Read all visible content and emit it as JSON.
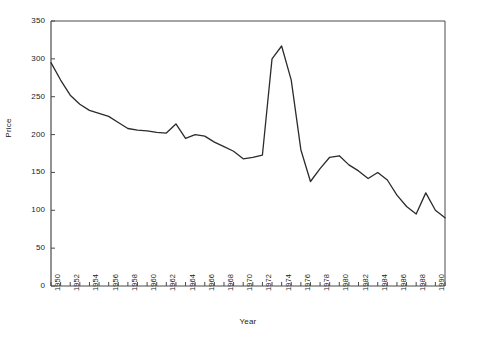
{
  "chart_data": {
    "type": "line",
    "title": "",
    "xlabel": "Year",
    "ylabel": "Price",
    "xlim": [
      1950,
      1991
    ],
    "ylim": [
      0,
      350
    ],
    "grid": false,
    "legend": null,
    "yticks": [
      0,
      50,
      100,
      150,
      200,
      250,
      300,
      350
    ],
    "ytick_labels": [
      "0",
      "50",
      "100",
      "150",
      "200",
      "250",
      "300",
      "350"
    ],
    "xticks": [
      1950,
      1951,
      1952,
      1953,
      1954,
      1955,
      1956,
      1957,
      1958,
      1959,
      1960,
      1961,
      1962,
      1963,
      1964,
      1965,
      1966,
      1967,
      1968,
      1969,
      1970,
      1971,
      1972,
      1973,
      1974,
      1975,
      1976,
      1977,
      1978,
      1979,
      1980,
      1981,
      1982,
      1983,
      1984,
      1985,
      1986,
      1987,
      1988,
      1989,
      1990,
      1991
    ],
    "xtick_labels": [
      "1950",
      "",
      "1952",
      "",
      "1954",
      "",
      "1956",
      "",
      "1958",
      "",
      "1960",
      "",
      "1962",
      "",
      "1964",
      "",
      "1966",
      "",
      "1968",
      "",
      "1970",
      "",
      "1972",
      "",
      "1974",
      "",
      "1976",
      "",
      "1978",
      "",
      "1980",
      "",
      "1982",
      "",
      "1984",
      "",
      "1986",
      "",
      "1988",
      "",
      "1990",
      ""
    ],
    "x": [
      1950,
      1951,
      1952,
      1953,
      1954,
      1955,
      1956,
      1957,
      1958,
      1959,
      1960,
      1961,
      1962,
      1963,
      1964,
      1965,
      1966,
      1967,
      1968,
      1969,
      1970,
      1971,
      1972,
      1973,
      1974,
      1975,
      1976,
      1977,
      1978,
      1979,
      1980,
      1981,
      1982,
      1983,
      1984,
      1985,
      1986,
      1987,
      1988,
      1989,
      1990,
      1991
    ],
    "values": [
      295,
      272,
      252,
      240,
      232,
      228,
      224,
      216,
      208,
      206,
      205,
      203,
      202,
      214,
      195,
      200,
      198,
      190,
      184,
      178,
      168,
      170,
      173,
      300,
      317,
      272,
      180,
      138,
      155,
      170,
      172,
      160,
      152,
      142,
      150,
      140,
      120,
      105,
      95,
      123,
      100,
      90
    ],
    "series_color": "#2b2b2b",
    "axis_color": "#4a4a4a"
  }
}
